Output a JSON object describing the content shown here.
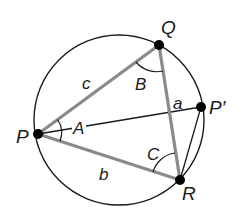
{
  "diagram": {
    "type": "circumscribed-triangle",
    "colors": {
      "background": "#ffffff",
      "circle": "#1a1a1a",
      "triangle_edges": "#8a8a8a",
      "thin_lines": "#1a1a1a",
      "points": "#000000",
      "labels": "#1a1a1a"
    },
    "circle": {
      "cx": 119,
      "cy": 120,
      "r": 85
    },
    "points": {
      "P": {
        "label": "P",
        "x": 38,
        "y": 134,
        "lx": 18,
        "ly": 142
      },
      "Q": {
        "label": "Q",
        "x": 159,
        "y": 45,
        "lx": 161,
        "ly": 35
      },
      "R": {
        "label": "R",
        "x": 180,
        "y": 180,
        "lx": 182,
        "ly": 200
      },
      "P_prime": {
        "label": "P′",
        "x": 201,
        "y": 107,
        "lx": 210,
        "ly": 113
      }
    },
    "sides": {
      "a": {
        "label": "a",
        "x": 179,
        "y": 108
      },
      "b": {
        "label": "b",
        "x": 104,
        "y": 180
      },
      "c": {
        "label": "c",
        "x": 87,
        "y": 90
      }
    },
    "angles": {
      "A": {
        "label": "A",
        "x": 75,
        "y": 133
      },
      "B": {
        "label": "B",
        "x": 134,
        "y": 89
      },
      "C": {
        "label": "C",
        "x": 147,
        "y": 159
      }
    },
    "segments": [
      {
        "from": "P",
        "to": "Q",
        "style": "thick-gray",
        "side": "c"
      },
      {
        "from": "Q",
        "to": "R",
        "style": "thick-gray",
        "side": "a"
      },
      {
        "from": "P",
        "to": "R",
        "style": "thick-gray",
        "side": "b"
      },
      {
        "from": "P",
        "to": "P_prime",
        "style": "thin-black"
      },
      {
        "from": "P_prime",
        "to": "R",
        "style": "thin-black"
      }
    ]
  }
}
